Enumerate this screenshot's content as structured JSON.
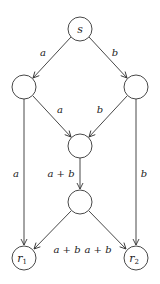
{
  "diagram": {
    "type": "network-coding-butterfly",
    "nodes": [
      {
        "id": "s",
        "label": "s",
        "x": 80,
        "y": 29
      },
      {
        "id": "left",
        "label": "",
        "x": 24,
        "y": 87
      },
      {
        "id": "right",
        "label": "",
        "x": 136,
        "y": 87
      },
      {
        "id": "middle",
        "label": "",
        "x": 80,
        "y": 146
      },
      {
        "id": "lower",
        "label": "",
        "x": 80,
        "y": 202
      },
      {
        "id": "r1",
        "label": "r",
        "sub": "1",
        "x": 24,
        "y": 258
      },
      {
        "id": "r2",
        "label": "r",
        "sub": "2",
        "x": 136,
        "y": 258
      }
    ],
    "edges": [
      {
        "from": "s",
        "to": "left",
        "label": "a"
      },
      {
        "from": "s",
        "to": "right",
        "label": "b"
      },
      {
        "from": "left",
        "to": "middle",
        "label": "a"
      },
      {
        "from": "right",
        "to": "middle",
        "label": "b"
      },
      {
        "from": "left",
        "to": "r1",
        "label": "a"
      },
      {
        "from": "right",
        "to": "r2",
        "label": "b"
      },
      {
        "from": "middle",
        "to": "lower",
        "label": "a + b"
      },
      {
        "from": "lower",
        "to": "r1",
        "label": "a + b"
      },
      {
        "from": "lower",
        "to": "r2",
        "label": "a + b"
      }
    ]
  }
}
